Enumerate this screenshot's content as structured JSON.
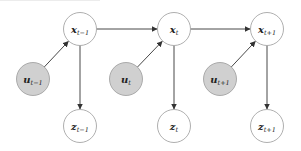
{
  "diagram": {
    "type": "graphical-model",
    "colors": {
      "observed_fill": "#d0d0d0",
      "latent_fill": "#ffffff",
      "stroke": "#9a9a9a",
      "edge": "#333333"
    },
    "nodes": {
      "x": [
        {
          "id": "x_t-1",
          "base": "x",
          "sub": "t−1",
          "cx": 80,
          "cy": 29
        },
        {
          "id": "x_t",
          "base": "x",
          "sub": "t",
          "cx": 174,
          "cy": 29
        },
        {
          "id": "x_t+1",
          "base": "x",
          "sub": "t+1",
          "cx": 267,
          "cy": 29
        }
      ],
      "u": [
        {
          "id": "u_t-1",
          "base": "u",
          "sub": "t−1",
          "cx": 33,
          "cy": 79
        },
        {
          "id": "u_t",
          "base": "u",
          "sub": "t",
          "cx": 126,
          "cy": 79
        },
        {
          "id": "u_t+1",
          "base": "u",
          "sub": "t+1",
          "cx": 220,
          "cy": 79
        }
      ],
      "z": [
        {
          "id": "z_t-1",
          "base": "z",
          "sub": "t−1",
          "cx": 80,
          "cy": 126
        },
        {
          "id": "z_t",
          "base": "z",
          "sub": "t",
          "cx": 174,
          "cy": 126
        },
        {
          "id": "z_t+1",
          "base": "z",
          "sub": "t+1",
          "cx": 267,
          "cy": 126
        }
      ]
    },
    "edges": [
      {
        "from": "x_t-1",
        "to": "x_t"
      },
      {
        "from": "x_t",
        "to": "x_t+1"
      },
      {
        "from": "u_t-1",
        "to": "x_t-1"
      },
      {
        "from": "u_t",
        "to": "x_t"
      },
      {
        "from": "u_t+1",
        "to": "x_t+1"
      },
      {
        "from": "x_t-1",
        "to": "z_t-1"
      },
      {
        "from": "x_t",
        "to": "z_t"
      },
      {
        "from": "x_t+1",
        "to": "z_t+1"
      }
    ]
  }
}
